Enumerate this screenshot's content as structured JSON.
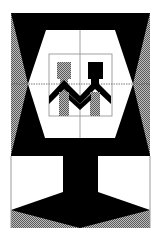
{
  "colors": {
    "black": "#000000",
    "white": "#ffffff",
    "gray_dark": "#6a6a6a",
    "gray_light": "#bdbdbd",
    "line": "#8a8a8a"
  }
}
